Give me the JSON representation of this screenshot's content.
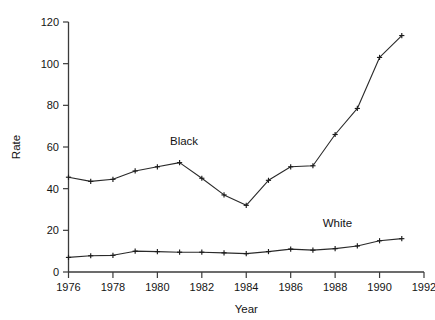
{
  "chart_data": {
    "type": "line",
    "title": "",
    "xlabel": "Year",
    "ylabel": "Rate",
    "xlim": [
      1976,
      1992
    ],
    "ylim": [
      0,
      120
    ],
    "xticks": [
      1976,
      1978,
      1980,
      1982,
      1984,
      1986,
      1988,
      1990,
      1992
    ],
    "yticks": [
      0,
      20,
      40,
      60,
      80,
      100,
      120
    ],
    "xtick_labels": [
      "1976",
      "1978",
      "1980",
      "1982",
      "1984",
      "1986",
      "1988",
      "1990",
      "1992"
    ],
    "ytick_labels": [
      "0",
      "20",
      "40",
      "60",
      "80",
      "100",
      "120"
    ],
    "grid": false,
    "legend_position": "inline-annotation",
    "marker": "plus-cross",
    "x": [
      1976,
      1977,
      1978,
      1979,
      1980,
      1981,
      1982,
      1983,
      1984,
      1985,
      1986,
      1987,
      1988,
      1989,
      1990,
      1991
    ],
    "series": [
      {
        "name": "Black",
        "label": "Black",
        "color": "#2a2a2a",
        "values": [
          45.5,
          43.5,
          44.5,
          48.5,
          50.5,
          52.5,
          45.0,
          37.0,
          32.0,
          44.0,
          50.5,
          51.0,
          66.0,
          78.5,
          103.0,
          113.5
        ],
        "annotation": {
          "text": "Black",
          "x": 1981.2,
          "y": 61.0
        }
      },
      {
        "name": "White",
        "label": "White",
        "color": "#2a2a2a",
        "values": [
          7.0,
          7.8,
          8.0,
          10.0,
          9.8,
          9.5,
          9.5,
          9.2,
          8.8,
          9.8,
          11.0,
          10.5,
          11.2,
          12.5,
          15.0,
          16.0
        ],
        "annotation": {
          "text": "White",
          "x": 1988.1,
          "y": 21.5
        }
      }
    ]
  },
  "axes": {
    "y_title": "Rate",
    "x_title": "Year"
  }
}
